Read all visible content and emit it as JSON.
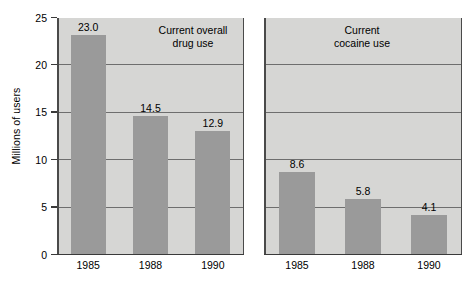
{
  "chart_data": {
    "type": "bar",
    "title": "",
    "xlabel": "",
    "ylabel": "Millions of users",
    "ylim": [
      0,
      25
    ],
    "yticks": [
      0,
      5,
      10,
      15,
      20,
      25
    ],
    "ytick_labels": [
      "0",
      "5",
      "10",
      "15",
      "20",
      "25"
    ],
    "grid": true,
    "gridlines_at": [
      5,
      10,
      15,
      20
    ],
    "legend": "none",
    "categories": [
      "1985",
      "1988",
      "1990"
    ],
    "panels": [
      {
        "title": "Current overall\ndrug use",
        "title_line1": "Current overall",
        "title_line2": "drug use",
        "categories": [
          "1985",
          "1988",
          "1990"
        ],
        "values": [
          23.0,
          14.5,
          12.9
        ],
        "value_labels": [
          "23.0",
          "14.5",
          "12.9"
        ]
      },
      {
        "title": "Current\ncocaine use",
        "title_line1": "Current",
        "title_line2": "cocaine use",
        "categories": [
          "1985",
          "1988",
          "1990"
        ],
        "values": [
          8.6,
          5.8,
          4.1
        ],
        "value_labels": [
          "8.6",
          "5.8",
          "4.1"
        ]
      }
    ],
    "colors": {
      "bar": "#9a9a9a",
      "plot_background": "#d6d6d4",
      "figure_background": "#ffffff",
      "gridline": "#6e6e6e",
      "axis": "#3a3a3a",
      "text": "#000000"
    }
  }
}
